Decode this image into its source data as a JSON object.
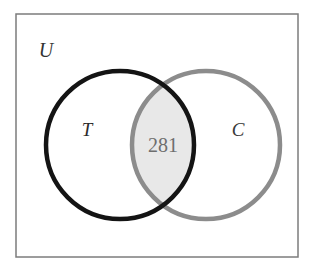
{
  "diagram": {
    "type": "venn-2-set",
    "title_visible": false,
    "universe": {
      "label": "U",
      "label_x": 46,
      "label_y": 57,
      "font_size": 20,
      "color": "#333333",
      "rect": {
        "x": 16,
        "y": 14,
        "width": 282,
        "height": 243
      },
      "border_color": "#7c7c7c",
      "border_width": 1.5,
      "fill": "#ffffff"
    },
    "sets": [
      {
        "name": "set-t",
        "label": "T",
        "label_x": 87,
        "label_y": 136,
        "font_size": 19,
        "label_color": "#2b2b2b",
        "cx": 120,
        "cy": 145,
        "r": 74,
        "stroke": "#141414",
        "stroke_width": 4.5,
        "fill": "none"
      },
      {
        "name": "set-c",
        "label": "C",
        "label_x": 238,
        "label_y": 136,
        "font_size": 19,
        "label_color": "#3a3a3a",
        "cx": 206,
        "cy": 145,
        "r": 74,
        "stroke": "#8c8c8c",
        "stroke_width": 4.5,
        "fill": "none"
      }
    ],
    "intersection": {
      "name": "intersection-t-and-c",
      "value": "281",
      "label_x": 163,
      "label_y": 152,
      "font_size": 20,
      "text_color": "#6e6e6e",
      "fill": "#e8e8e8"
    },
    "colors": {
      "background": "#ffffff",
      "universe_border": "#7c7c7c",
      "set_t_stroke": "#141414",
      "set_c_stroke": "#8c8c8c",
      "intersection_fill": "#e8e8e8",
      "intersection_text": "#6e6e6e",
      "label_text": "#2b2b2b"
    }
  }
}
